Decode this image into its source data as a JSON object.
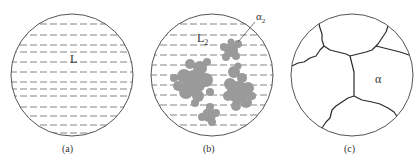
{
  "figure": {
    "panels": [
      {
        "id": "a",
        "caption": "(a)",
        "phase_label": "L",
        "description": "liquid"
      },
      {
        "id": "b",
        "caption": "(b)",
        "phase_label": "L",
        "phase_label_sub": "2",
        "callout_label": "α",
        "callout_label_sub": "2",
        "description": "liquid with alpha2 dendritic particles"
      },
      {
        "id": "c",
        "caption": "(c)",
        "phase_label": "α",
        "description": "alpha grains"
      }
    ],
    "colors": {
      "outline": "#555555",
      "dash": "#777777",
      "particle": "#9a9a9a",
      "grain_boundary": "#2a2a2a"
    }
  }
}
